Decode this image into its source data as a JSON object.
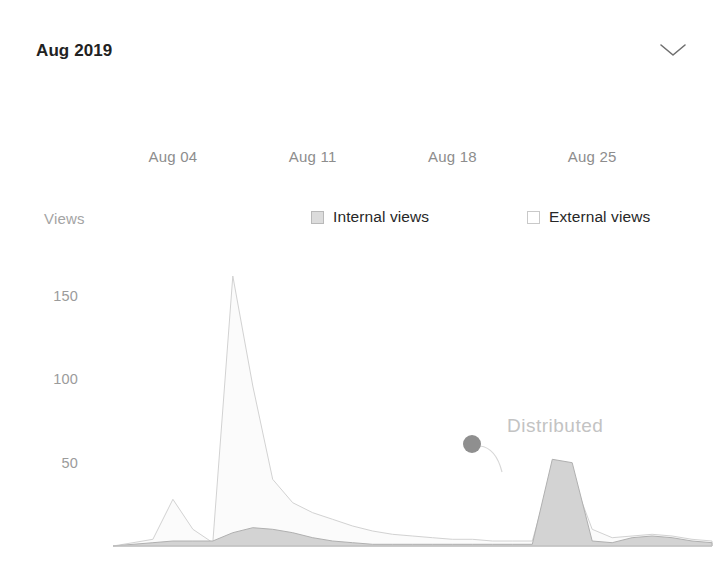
{
  "header": {
    "title": "Aug 2019",
    "collapse_icon": "chevron-down-icon"
  },
  "legend": {
    "axis_name": "Views",
    "items": [
      {
        "label": "Internal views",
        "swatch": "filled",
        "color": "#dcdcdc"
      },
      {
        "label": "External views",
        "swatch": "hollow",
        "color": "#ffffff"
      }
    ]
  },
  "annotations": [
    {
      "text": "Distributed",
      "x": 507,
      "y": 415,
      "marker_x": 472,
      "marker_y": 444,
      "marker_color": "#8f8f8f"
    }
  ],
  "chart_data": {
    "type": "area",
    "title": "Aug 2019",
    "xlabel": "",
    "ylabel": "Views",
    "ylim": [
      0,
      170
    ],
    "yticks": [
      50,
      100,
      150
    ],
    "grid": false,
    "legend_position": "top",
    "xtick_labels": [
      "Aug 04",
      "Aug 11",
      "Aug 18",
      "Aug 25"
    ],
    "xtick_days": [
      4,
      11,
      18,
      25
    ],
    "x": [
      "Aug 01",
      "Aug 02",
      "Aug 03",
      "Aug 04",
      "Aug 05",
      "Aug 06",
      "Aug 07",
      "Aug 08",
      "Aug 09",
      "Aug 10",
      "Aug 11",
      "Aug 12",
      "Aug 13",
      "Aug 14",
      "Aug 15",
      "Aug 16",
      "Aug 17",
      "Aug 18",
      "Aug 19",
      "Aug 20",
      "Aug 21",
      "Aug 22",
      "Aug 23",
      "Aug 24",
      "Aug 25",
      "Aug 26",
      "Aug 27",
      "Aug 28",
      "Aug 29",
      "Aug 30",
      "Aug 31"
    ],
    "series": [
      {
        "name": "External views",
        "fill": "#fbfbfb",
        "stroke": "#d2d2d2",
        "values": [
          0,
          2,
          4,
          28,
          10,
          2,
          162,
          96,
          40,
          26,
          20,
          16,
          12,
          9,
          7,
          6,
          5,
          4,
          4,
          3,
          3,
          3,
          46,
          42,
          10,
          5,
          6,
          7,
          6,
          4,
          3
        ]
      },
      {
        "name": "Internal views",
        "fill": "#d3d3d3",
        "stroke": "#b0b0b0",
        "values": [
          0,
          1,
          2,
          3,
          3,
          3,
          8,
          11,
          10,
          8,
          5,
          3,
          2,
          1,
          1,
          1,
          1,
          1,
          1,
          1,
          1,
          1,
          52,
          50,
          3,
          2,
          5,
          6,
          5,
          3,
          2
        ]
      }
    ],
    "highlight_point": {
      "series": "Internal views",
      "x": "Aug 23",
      "value": 52,
      "label": "Distributed"
    }
  }
}
